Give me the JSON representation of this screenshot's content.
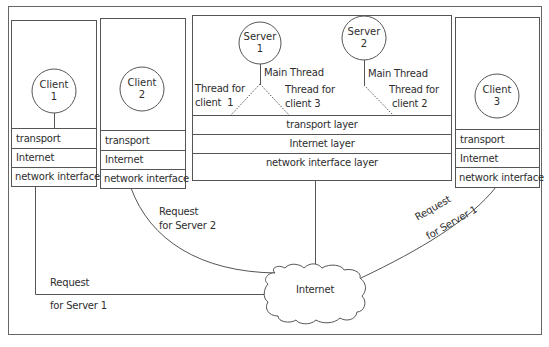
{
  "diagram": {
    "clients": [
      {
        "id": "client-1",
        "title": "Client",
        "number": "1",
        "layers": [
          "transport",
          "Internet",
          "network interface"
        ]
      },
      {
        "id": "client-2",
        "title": "Client",
        "number": "2",
        "layers": [
          "transport",
          "Internet",
          "network interface"
        ]
      },
      {
        "id": "client-3",
        "title": "Client",
        "number": "3",
        "layers": [
          "transport",
          "Internet",
          "network interface"
        ]
      }
    ],
    "server_host": {
      "servers": [
        {
          "id": "server-1",
          "title": "Server",
          "number": "1"
        },
        {
          "id": "server-2",
          "title": "Server",
          "number": "2"
        }
      ],
      "threads": {
        "server1_main": "Main Thread",
        "server1_thread_a_line1": "Thread for",
        "server1_thread_a_line2": "client  1",
        "server1_thread_b_line1": "Thread for",
        "server1_thread_b_line2": "client 3",
        "server2_main": "Main Thread",
        "server2_thread_line1": "Thread for",
        "server2_thread_line2": "client 2"
      },
      "layers": [
        "transport layer",
        "Internet layer",
        "network interface layer"
      ]
    },
    "network": {
      "cloud_label": "Internet"
    },
    "connections": [
      {
        "from": "client-1",
        "to": "Internet",
        "label_line1": "Request",
        "label_line2": "for Server 1"
      },
      {
        "from": "client-2",
        "to": "Internet",
        "label_line1": "Request",
        "label_line2": "for Server 2"
      },
      {
        "from": "client-3",
        "to": "Internet",
        "label_line1": "Request",
        "label_line2": "for Server 1"
      },
      {
        "from": "server-host",
        "to": "Internet",
        "label_line1": "",
        "label_line2": ""
      }
    ],
    "colors": {
      "line": "#555555",
      "background": "#ffffff",
      "text": "#2e2e2e"
    }
  }
}
